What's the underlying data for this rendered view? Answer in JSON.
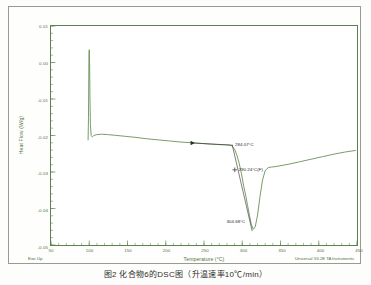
{
  "document": {
    "caption": "图2  化合物6的DSC图（升温速率10℃/min）"
  },
  "chart": {
    "exo_direction_label": "Exo Up",
    "instrument_footer": "Universal V4.2E TA Instruments"
  },
  "chart_data": {
    "type": "line",
    "title": "",
    "xlabel": "Temperature (°C)",
    "ylabel": "Heat Flow (W/g)",
    "xlim": [
      50,
      450
    ],
    "ylim": [
      -0.05,
      0.01
    ],
    "xticks": [
      50,
      100,
      150,
      200,
      250,
      300,
      350,
      400,
      450
    ],
    "xtick_labels": [
      "50",
      "100",
      "150",
      "200",
      "250",
      "300",
      "350",
      "400",
      "450"
    ],
    "yticks": [
      0.01,
      0.0,
      -0.01,
      -0.02,
      -0.03,
      -0.04,
      -0.05
    ],
    "ytick_labels": [
      "0.01",
      "0.00",
      "-0.01",
      "-0.02",
      "-0.03",
      "-0.04",
      "-0.05"
    ],
    "x_minor_tick_interval": 10,
    "y_minor_tick_interval": 0.002,
    "grid": false,
    "legend": null,
    "line_color": "#5f8a4e",
    "annotation_color": "#2a2a2a",
    "series": [
      {
        "name": "DSC heat flow",
        "color": "#5f8a4e",
        "x": [
          98.5,
          99.0,
          99.6,
          100.0,
          100.4,
          100.9,
          101.5,
          102.5,
          104.0,
          106.0,
          110.0,
          116.0,
          124.0,
          134.0,
          146.0,
          160.0,
          175.0,
          190.0,
          205.0,
          220.0,
          235.0,
          248.0,
          258.0,
          266.0,
          272.0,
          277.0,
          281.0,
          284.0,
          287.0,
          290.0,
          293.0,
          296.0,
          299.0,
          302.0,
          304.7,
          307.0,
          309.5,
          312.0,
          314.5,
          317.0,
          320.0,
          323.0,
          326.5,
          330.0,
          334.0,
          338.0,
          344.0,
          352.0,
          362.0,
          375.0,
          390.0,
          405.0,
          420.0,
          435.0,
          448.0
        ],
        "y": [
          -0.0212,
          -0.015,
          0.002,
          0.0035,
          0.0005,
          -0.009,
          -0.017,
          -0.02,
          -0.0204,
          -0.02,
          -0.01975,
          -0.01965,
          -0.01975,
          -0.01995,
          -0.0202,
          -0.0205,
          -0.0209,
          -0.0212,
          -0.0215,
          -0.0218,
          -0.022,
          -0.0222,
          -0.02235,
          -0.02245,
          -0.0225,
          -0.02255,
          -0.0226,
          -0.02265,
          -0.0229,
          -0.0238,
          -0.0254,
          -0.0276,
          -0.0305,
          -0.034,
          -0.0366,
          -0.0392,
          -0.042,
          -0.0445,
          -0.0457,
          -0.045,
          -0.0418,
          -0.037,
          -0.0322,
          -0.0296,
          -0.0288,
          -0.02865,
          -0.0285,
          -0.0282,
          -0.0278,
          -0.0272,
          -0.0265,
          -0.0258,
          -0.0251,
          -0.0245,
          -0.0241
        ]
      }
    ],
    "annotations": [
      {
        "name": "onset-temperature",
        "text": "284.07°C",
        "x": 284.07,
        "y": -0.02265,
        "label_x": 289.0,
        "label_y": -0.0222
      },
      {
        "name": "inflection-temperature",
        "text": "290.24°C(F)",
        "x": 290.24,
        "y": -0.0294,
        "label_x": 293.5,
        "label_y": -0.0292
      },
      {
        "name": "peak-temperature",
        "text": "304.68°C",
        "x": 304.68,
        "y": -0.0436,
        "label_x": 278.0,
        "label_y": -0.0432
      }
    ],
    "tangent_lines": [
      {
        "name": "baseline-tangent",
        "x1": 235.0,
        "y1": -0.02205,
        "x2": 288.0,
        "y2": -0.02265
      },
      {
        "name": "leading-edge-tangent",
        "x1": 287.0,
        "y1": -0.02265,
        "x2": 313.0,
        "y2": -0.0462
      }
    ],
    "markers": [
      {
        "name": "baseline-arrow-marker",
        "x": 235.0,
        "y": -0.02205,
        "shape": "triangle-right"
      },
      {
        "name": "inflection-cross-marker",
        "x": 290.24,
        "y": -0.0294,
        "shape": "cross"
      }
    ]
  }
}
